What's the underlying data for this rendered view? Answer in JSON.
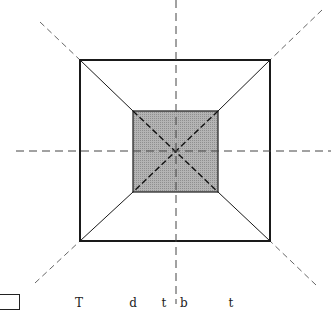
{
  "diagram": {
    "outer_square": {
      "x1": 80,
      "y1": 60,
      "x2": 270,
      "y2": 241,
      "stroke": "#1a1a1a"
    },
    "inner_square": {
      "x1": 133,
      "y1": 111,
      "x2": 218,
      "y2": 192,
      "fill": "#a9a9a9",
      "stroke": "#1a1a1a"
    },
    "center": {
      "x": 175,
      "y": 151
    },
    "axes": {
      "vertical_x": 176,
      "horizontal_y": 151,
      "style": "dashed",
      "color": "#444444"
    },
    "bottom_caption_fragment": "T        d    t  b       t"
  }
}
